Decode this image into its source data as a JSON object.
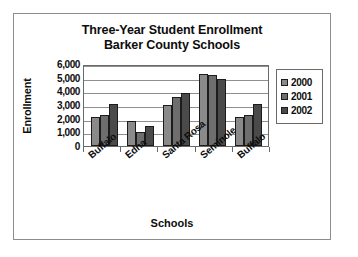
{
  "chart_data": {
    "type": "bar",
    "title": "Three-Year Student Enrollment",
    "subtitle": "Barker County Schools",
    "xlabel": "Schools",
    "ylabel": "Enrollment",
    "categories": [
      "Buffalo",
      "Edna",
      "Santa Rosa",
      "Seminole",
      "Buffalo"
    ],
    "series": [
      {
        "name": "2000",
        "color": "#8a8a8a",
        "values": [
          2100,
          1800,
          3000,
          5300,
          2100
        ]
      },
      {
        "name": "2001",
        "color": "#6e6e6e",
        "values": [
          2300,
          1000,
          3600,
          5200,
          2250
        ]
      },
      {
        "name": "2002",
        "color": "#4a4a4a",
        "values": [
          3100,
          1500,
          3850,
          4900,
          3100
        ]
      }
    ],
    "ylim": [
      0,
      6000
    ],
    "ytick_values": [
      6000,
      5000,
      4000,
      3000,
      2000,
      1000,
      0
    ],
    "ytick_labels": [
      "6,000",
      "5,000",
      "4,000",
      "3,000",
      "2,000",
      "1,000",
      "0"
    ],
    "grid": true,
    "legend_position": "right"
  }
}
